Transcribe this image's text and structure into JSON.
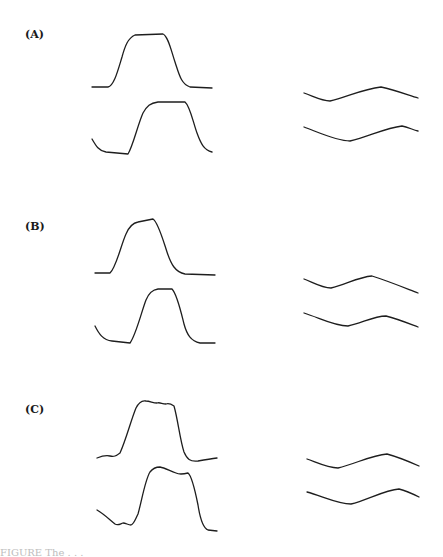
{
  "figure": {
    "panels": [
      {
        "label": "(A)",
        "left_traces": [
          "M92,87 L108,87 C114,86 118,70 122,57 C125,46 128,38 135,35 L163,34 C168,36 171,50 175,62 C179,74 181,84 190,87 L212,88",
          "M92,139 C96,146 99,151 106,152 L128,154 C133,146 138,124 143,113 C147,106 150,103 158,102 L185,102 C190,106 193,122 197,133 C201,144 204,150 212,152"
        ],
        "right_traces": [
          "M304,93 C315,97 322,101 330,101 C345,98 362,89 381,87 C395,90 408,95 418,98",
          "M304,127 C320,133 337,141 350,141 C368,137 385,128 402,126 C408,127 413,130 418,131"
        ]
      },
      {
        "label": "(B)",
        "left_traces": [
          "M95,273 L110,273 C116,268 121,245 126,234 C129,227 132,223 138,222 L153,219 C158,222 163,240 167,252 C171,264 175,272 185,274 L215,275",
          "M95,326 C99,334 103,340 112,341 L130,343 C136,335 142,310 146,300 C149,293 152,290 158,289 L172,289 C177,294 181,312 184,324 C187,335 191,341 200,343 L215,343"
        ],
        "right_traces": [
          "M304,279 C314,283 322,288 331,288 C345,285 358,277 372,276 C388,281 405,288 418,293",
          "M304,313 C320,318 334,326 348,326 C362,323 374,316 386,316 C398,319 410,324 418,327"
        ]
      },
      {
        "label": "(C)",
        "left_traces": [
          "M97,458 C102,456 106,455 110,456 C114,457 116,456 120,453 C126,440 131,420 136,408 C139,402 142,400 146,401 C150,401 153,403 157,403 C160,402 162,404 166,404 C169,403 171,404 174,406 C178,420 180,440 184,452 C187,459 190,462 198,461 C204,460 210,459 217,458",
          "M97,510 C104,514 110,520 115,524 C118,526 120,524 123,523 C126,523 128,525 131,525 C134,524 135,520 138,514 C142,500 145,480 150,472 C153,468 156,467 160,467 C165,468 170,471 176,473 C180,475 184,474 188,473 C192,476 195,490 198,505 C200,518 203,528 208,530 L217,531"
        ],
        "right_traces": [
          "M307,459 C318,463 328,468 338,468 C355,464 372,455 387,454 C398,457 410,462 419,466",
          "M307,492 C322,496 338,504 351,504 C367,500 385,490 399,489 C407,491 413,494 419,497"
        ]
      }
    ],
    "caption": "FIGURE    The  . . ."
  }
}
